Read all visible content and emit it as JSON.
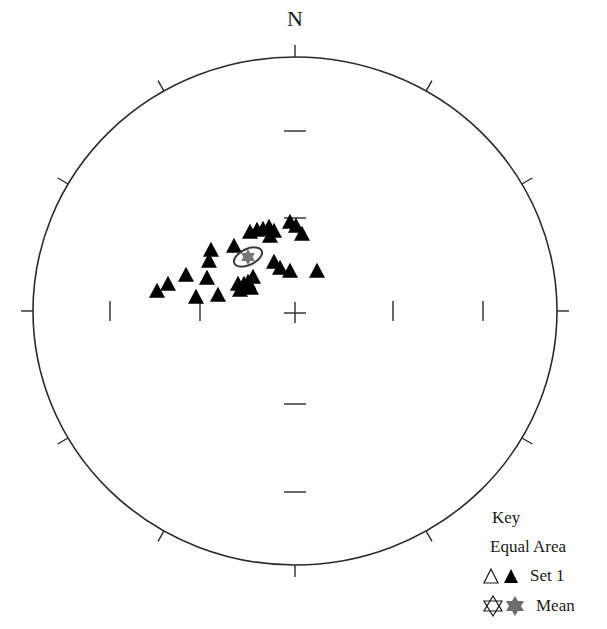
{
  "chart_data": {
    "type": "scatter",
    "subtype": "stereonet",
    "title": "",
    "north_label": "N",
    "projection": "Equal Area",
    "net": {
      "center_px": [
        295,
        311
      ],
      "radius_px": [
        262,
        254
      ],
      "outer_tick_interval_deg": 30,
      "inner_ticks_px": {
        "horizontal_x": [
          110,
          200,
          393,
          483
        ],
        "vertical_y": [
          131,
          218,
          404,
          492
        ]
      }
    },
    "series": [
      {
        "name": "Set 1",
        "marker": "filled-triangle",
        "color": "#000000",
        "points_px": [
          [
            157,
            292
          ],
          [
            168,
            285
          ],
          [
            186,
            276
          ],
          [
            196,
            298
          ],
          [
            207,
            279
          ],
          [
            218,
            296
          ],
          [
            209,
            262
          ],
          [
            211,
            251
          ],
          [
            234,
            247
          ],
          [
            238,
            285
          ],
          [
            244,
            285
          ],
          [
            248,
            283
          ],
          [
            253,
            278
          ],
          [
            240,
            291
          ],
          [
            251,
            289
          ],
          [
            250,
            233
          ],
          [
            257,
            231
          ],
          [
            263,
            230
          ],
          [
            269,
            228
          ],
          [
            274,
            232
          ],
          [
            270,
            237
          ],
          [
            290,
            223
          ],
          [
            296,
            227
          ],
          [
            302,
            235
          ],
          [
            274,
            263
          ],
          [
            280,
            269
          ],
          [
            290,
            272
          ],
          [
            317,
            272
          ]
        ]
      },
      {
        "name": "Mean",
        "marker": "filled-star",
        "color": "#777777",
        "points_px": [
          [
            248,
            257
          ]
        ],
        "confidence_ellipse_px": {
          "cx": 248,
          "cy": 257,
          "rx": 15,
          "ry": 8,
          "rotation_deg": -25
        }
      }
    ],
    "legend": {
      "title": "Key",
      "position": "bottom-right",
      "entries": [
        {
          "symbols": [
            "open-triangle",
            "filled-triangle"
          ],
          "label": "Set 1"
        },
        {
          "symbols": [
            "open-star",
            "filled-star"
          ],
          "label": "Mean"
        }
      ]
    }
  },
  "plot": {
    "north_label": "N"
  },
  "legend": {
    "title": "Key",
    "projection": "Equal Area",
    "set_label": "Set 1",
    "mean_label": "Mean"
  },
  "colors": {
    "circle": "#2a2a2a",
    "marker": "#000000",
    "mean_fill": "#6e6e6e",
    "ellipse_stroke": "#3a3a3a"
  }
}
